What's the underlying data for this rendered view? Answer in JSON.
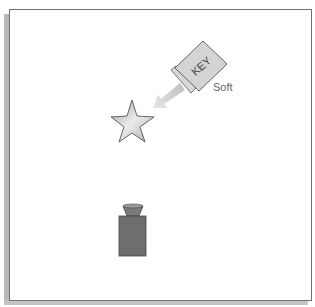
{
  "diagram": {
    "type": "lighting-setup",
    "lights": [
      {
        "id": "key",
        "label": "KEY",
        "quality_label": "Soft",
        "color": "#c9c9c9",
        "direction": "toward-subject"
      }
    ],
    "subject": {
      "shape": "star",
      "color": "#c8c8c8"
    },
    "camera": {
      "color": "#6e6e6e"
    },
    "colors": {
      "frame_border": "#707070",
      "shadow": "#b8b8b8",
      "arrow": "#d2d2d2",
      "label_text": "#666666"
    }
  }
}
